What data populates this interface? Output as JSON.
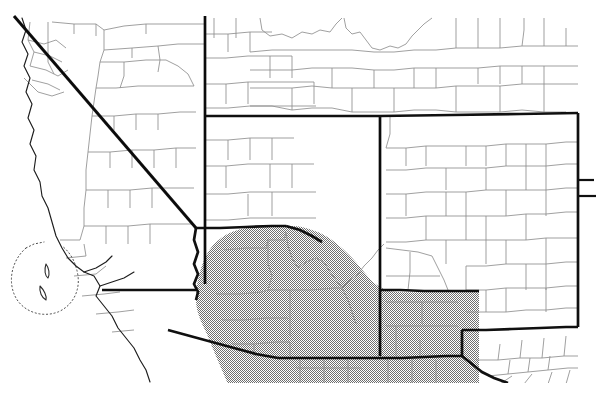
{
  "figure": {
    "kind": "scanned-reference-map",
    "title": "Southwestern United States distribution map",
    "caption": "",
    "background_color": "#ffffff",
    "width": 602,
    "height": 402
  },
  "legend": {
    "shaded_meaning": "shaded range / distribution area",
    "shaded_color": "#b2b2b2",
    "shaded_pattern": "halftone dither",
    "state_border_color": "#111111",
    "county_border_color": "#8d8d8d",
    "coastline_color": "#1a1a1a"
  },
  "labels": {
    "map_region": "map-region",
    "shaded_range": "shaded-range-overlay",
    "state_borders": "state-boundary-lines",
    "county_borders": "county-boundary-lines",
    "coastline": "pacific-coastline",
    "islands": "channel-islands",
    "offshore_dotted": "offshore-dotted-boundary"
  },
  "geometry": {
    "shaded_range_path": "M 196 296 L 198 281 L 202 265 L 209 250 L 219 239 L 232 232 L 249 228 L 268 226 L 285 226 L 285 226 L 300 226 L 316 227 L 334 230 L 352 236 L 368 245 L 381 256 L 392 268 L 400 279 L 407 288 L 417 291 L 432 291 L 452 291 L 470 291 L 479 291 L 479 306 L 479 321 L 479 337 L 479 352 L 479 368 L 479 383 L 440 383 L 400 383 L 360 383 L 320 383 L 280 383 L 240 383 L 226 383 L 222 370 L 216 352 L 209 333 L 202 315 Z",
    "state_borders": [
      "M 14 18 L 196 228",
      "M 205 17 L 205 290",
      "M 205 116 L 420 116",
      "M 420 116 L 578 113",
      "M 196 228 L 196 300",
      "M 95 268 L 196 268",
      "M 102 290 L 196 290",
      "M 176 336 L 270 336",
      "M 205 290 L 290 290",
      "M 170 340 L 290 340",
      "M 290 340 L 290 356",
      "M 290 356 L 380 356",
      "M 380 356 L 380 116",
      "M 380 356 L 460 356",
      "M 460 356 L 460 330",
      "M 460 330 L 578 327",
      "M 578 113 L 578 327",
      "M 460 356 L 478 372",
      "M 478 372 L 520 384"
    ],
    "coastline": "M 14 18 L 196 228 L 186 250 L 178 276 L 172 300 L 162 320 L 150 344 L 132 362 L 112 376",
    "pacific_dotted": "M 30 248 Q 10 278 26 304 Q 46 320 70 306 Q 84 286 76 258"
  },
  "counts": {
    "visible_states": 8,
    "visible_counties": 150
  }
}
